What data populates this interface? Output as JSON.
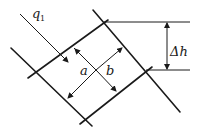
{
  "diagram": {
    "labels": {
      "flow": "q",
      "flow_subscript": "1",
      "side_a": "a",
      "side_b": "b",
      "head_drop": "Δh"
    }
  }
}
